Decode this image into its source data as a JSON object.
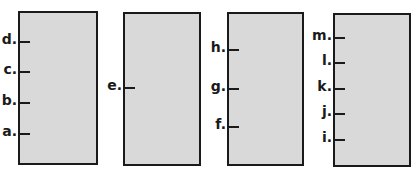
{
  "colors": {
    "box_fill": "#d9d9d9",
    "border": "#1a1a1a",
    "background": "#ffffff"
  },
  "boxes": [
    {
      "id": "box-1",
      "x": 18,
      "y": 11,
      "w": 80,
      "h": 154,
      "marks": [
        {
          "label": "d.",
          "y": 42
        },
        {
          "label": "c.",
          "y": 72
        },
        {
          "label": "b.",
          "y": 103
        },
        {
          "label": "a.",
          "y": 134
        }
      ]
    },
    {
      "id": "box-2",
      "x": 123,
      "y": 12,
      "w": 78,
      "h": 154,
      "marks": [
        {
          "label": "e.",
          "y": 88
        }
      ]
    },
    {
      "id": "box-3",
      "x": 227,
      "y": 12,
      "w": 77,
      "h": 154,
      "marks": [
        {
          "label": "h.",
          "y": 50
        },
        {
          "label": "g.",
          "y": 89
        },
        {
          "label": "f.",
          "y": 127
        }
      ]
    },
    {
      "id": "box-4",
      "x": 333,
      "y": 13,
      "w": 78,
      "h": 154,
      "marks": [
        {
          "label": "m.",
          "y": 38
        },
        {
          "label": "l.",
          "y": 63
        },
        {
          "label": "k.",
          "y": 89
        },
        {
          "label": "j.",
          "y": 114
        },
        {
          "label": "i.",
          "y": 140
        }
      ]
    }
  ]
}
